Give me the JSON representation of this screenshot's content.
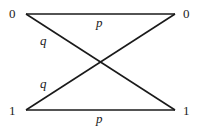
{
  "diagram": {
    "inputs": [
      {
        "label": "0",
        "x": 26,
        "y": 14
      },
      {
        "label": "1",
        "x": 26,
        "y": 110
      }
    ],
    "outputs": [
      {
        "label": "0",
        "x": 175,
        "y": 14
      },
      {
        "label": "1",
        "x": 175,
        "y": 110
      }
    ],
    "edges": [
      {
        "from": "0",
        "to": "0",
        "label": "p"
      },
      {
        "from": "1",
        "to": "1",
        "label": "p"
      },
      {
        "from": "0",
        "to": "1",
        "label": "q"
      },
      {
        "from": "1",
        "to": "0",
        "label": "q"
      }
    ],
    "colors": {
      "line": "#1a1a1a",
      "text": "#222222",
      "background": "#ffffff"
    }
  }
}
